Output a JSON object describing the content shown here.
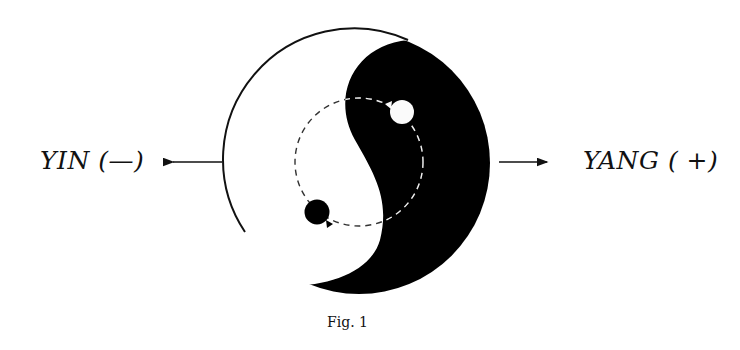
{
  "diagram": {
    "left_label": "YIN (—)",
    "right_label": "YANG ( +)",
    "caption": "Fig. 1",
    "colors": {
      "dark": "#000000",
      "light": "#ffffff",
      "stroke": "#111111",
      "dashed_orbit_on_light": "#333333",
      "dashed_orbit_on_dark": "#eeeeee"
    },
    "symbol": "yin-yang",
    "arrows": [
      {
        "direction": "left",
        "points_to": "YIN (—)"
      },
      {
        "direction": "right",
        "points_to": "YANG ( +)"
      }
    ]
  }
}
